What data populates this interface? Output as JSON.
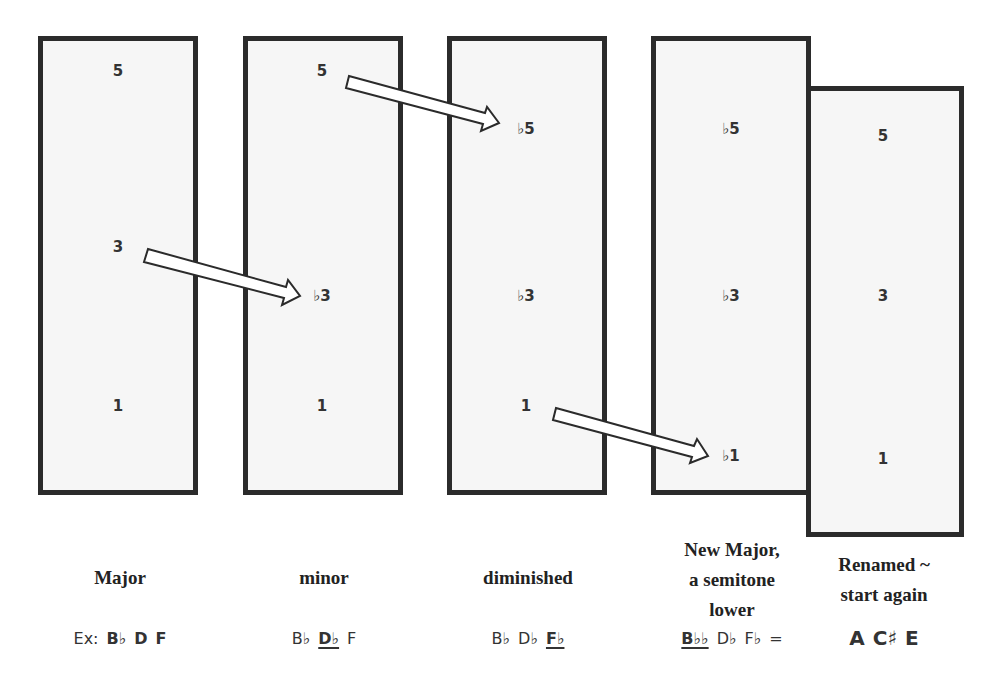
{
  "columns": [
    {
      "id": "major",
      "degrees": {
        "fifth": "5",
        "third": "3",
        "root": "1"
      },
      "label_lines": [
        "Major"
      ],
      "notes": [
        {
          "text": "Ex:",
          "style": "plain"
        },
        {
          "text": "B♭",
          "style": "bold"
        },
        {
          "text": "D",
          "style": "bold"
        },
        {
          "text": "F",
          "style": "bold"
        }
      ]
    },
    {
      "id": "minor",
      "degrees": {
        "fifth": "5",
        "third": "♭3",
        "root": "1"
      },
      "label_lines": [
        "minor"
      ],
      "notes": [
        {
          "text": "B♭",
          "style": "plain"
        },
        {
          "text": "D♭",
          "style": "underline-bold"
        },
        {
          "text": "F",
          "style": "plain"
        }
      ]
    },
    {
      "id": "diminished",
      "degrees": {
        "fifth": "♭5",
        "third": "♭3",
        "root": "1"
      },
      "label_lines": [
        "diminished"
      ],
      "notes": [
        {
          "text": "B♭",
          "style": "plain"
        },
        {
          "text": "D♭",
          "style": "plain"
        },
        {
          "text": "F♭",
          "style": "underline-bold"
        }
      ]
    },
    {
      "id": "new-major",
      "degrees": {
        "fifth": "♭5",
        "third": "♭3",
        "root": "♭1"
      },
      "label_lines": [
        "New Major,",
        "a semitone",
        "lower"
      ],
      "notes": [
        {
          "text": "B♭♭",
          "style": "underline-bold"
        },
        {
          "text": "D♭",
          "style": "plain"
        },
        {
          "text": "F♭",
          "style": "plain"
        },
        {
          "text": "=",
          "style": "plain"
        }
      ]
    },
    {
      "id": "renamed",
      "degrees": {
        "fifth": "5",
        "third": "3",
        "root": "1"
      },
      "label_lines": [
        "Renamed ~",
        "start again"
      ],
      "notes": [
        {
          "text": "A",
          "style": "bold"
        },
        {
          "text": "C♯",
          "style": "bold"
        },
        {
          "text": "E",
          "style": "bold"
        }
      ]
    }
  ],
  "arrows": [
    {
      "from": "major.third",
      "to": "minor.third"
    },
    {
      "from": "minor.fifth",
      "to": "diminished.fifth"
    },
    {
      "from": "diminished.root",
      "to": "new-major.root"
    }
  ],
  "colors": {
    "border": "#2b2b2b",
    "box_fill": "#f6f6f6",
    "text": "#2a2a2a",
    "arrow_fill": "#ffffff"
  }
}
